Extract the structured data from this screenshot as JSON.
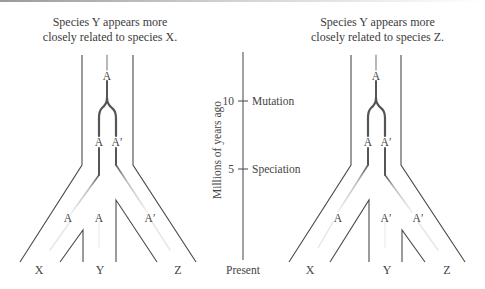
{
  "left_panel": {
    "caption_line1": "Species Y appears more",
    "caption_line2": "closely related to species X.",
    "gene_labels": {
      "root": "A",
      "after_mutation_left": "A",
      "after_mutation_right": "A′",
      "tip_x": "A",
      "tip_y": "A",
      "tip_z": "A′"
    },
    "species_labels": {
      "x": "X",
      "y": "Y",
      "z": "Z"
    }
  },
  "axis": {
    "title": "Millions of years ago",
    "ticks": [
      {
        "value": "10",
        "event": "Mutation"
      },
      {
        "value": "5",
        "event": "Speciation"
      }
    ],
    "bottom_label": "Present"
  },
  "right_panel": {
    "caption_line1": "Species Y appears more",
    "caption_line2": "closely related to species Z.",
    "gene_labels": {
      "root": "A",
      "after_mutation_left": "A",
      "after_mutation_right": "A′",
      "tip_x": "A",
      "tip_y": "A′",
      "tip_z": "A′"
    },
    "species_labels": {
      "x": "X",
      "y": "Y",
      "z": "Z"
    }
  },
  "colors": {
    "species_tree_line": "#4a4a4a",
    "gene_line_dark": "#5a5a5a",
    "gene_line_faded": "#d8d8d8"
  }
}
